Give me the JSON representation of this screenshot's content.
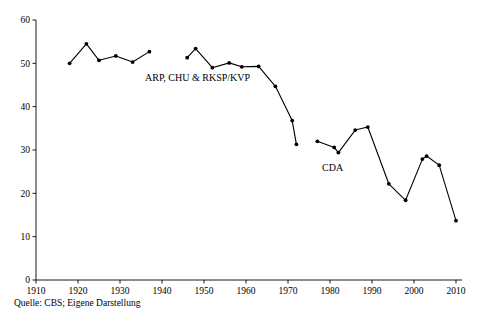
{
  "chart_data": {
    "type": "line",
    "title": "",
    "subtitle": "",
    "xlabel": "",
    "ylabel": "",
    "xlim": [
      1910,
      2010
    ],
    "ylim": [
      0,
      60
    ],
    "grid": false,
    "legend_position": "inline-annotations",
    "x_ticks": [
      "1910",
      "1920",
      "1930",
      "1940",
      "1950",
      "1960",
      "1970",
      "1980",
      "1990",
      "2000",
      "2010"
    ],
    "y_ticks": [
      "0",
      "10",
      "20",
      "30",
      "40",
      "50",
      "60"
    ],
    "series": [
      {
        "name": "ARP, CHU & RKSP/KVP",
        "annotation": "ARP, CHU & RKSP/KVP",
        "points": [
          {
            "x": 1918,
            "y": 50.0
          },
          {
            "x": 1922,
            "y": 54.5
          },
          {
            "x": 1925,
            "y": 50.7
          },
          {
            "x": 1929,
            "y": 51.7
          },
          {
            "x": 1933,
            "y": 50.3
          },
          {
            "x": 1937,
            "y": 52.7
          }
        ]
      },
      {
        "name": "ARP, CHU & RKSP/KVP (post-war)",
        "annotation": "",
        "points": [
          {
            "x": 1946,
            "y": 51.3
          },
          {
            "x": 1948,
            "y": 53.4
          },
          {
            "x": 1952,
            "y": 49.0
          },
          {
            "x": 1956,
            "y": 50.1
          },
          {
            "x": 1959,
            "y": 49.2
          },
          {
            "x": 1963,
            "y": 49.3
          },
          {
            "x": 1967,
            "y": 44.7
          },
          {
            "x": 1971,
            "y": 36.8
          },
          {
            "x": 1972,
            "y": 31.3
          }
        ]
      },
      {
        "name": "CDA",
        "annotation": "CDA",
        "points": [
          {
            "x": 1977,
            "y": 32.0
          },
          {
            "x": 1981,
            "y": 30.6
          },
          {
            "x": 1982,
            "y": 29.4
          },
          {
            "x": 1986,
            "y": 34.6
          },
          {
            "x": 1989,
            "y": 35.3
          },
          {
            "x": 1994,
            "y": 22.2
          },
          {
            "x": 1998,
            "y": 18.4
          },
          {
            "x": 2002,
            "y": 27.9
          },
          {
            "x": 2003,
            "y": 28.6
          },
          {
            "x": 2006,
            "y": 26.5
          },
          {
            "x": 2010,
            "y": 13.7
          }
        ]
      }
    ],
    "annotations": [
      {
        "text": "ARP, CHU & RKSP/KVP",
        "x_px": 145,
        "y_px": 81
      },
      {
        "text": "CDA",
        "x_px": 322,
        "y_px": 171
      }
    ],
    "colors": {
      "line": "#000000",
      "marker": "#000000",
      "axis": "#000000",
      "background": "#ffffff"
    }
  },
  "footer": {
    "source_note": "Quelle: CBS; Eigene Darstellung"
  }
}
